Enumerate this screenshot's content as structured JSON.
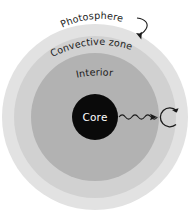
{
  "diagram": {
    "background_color": "#ffffff",
    "labels": {
      "photosphere": "Photosphere",
      "convective_zone": "Convective zone",
      "interior": "Interior",
      "core": "Core"
    },
    "layers": [
      {
        "name": "photosphere",
        "label": "Photosphere",
        "color": "#e2e2e2",
        "radius": 93,
        "shape": "circle"
      },
      {
        "name": "convective-zone",
        "label": "Convective zone",
        "color": "#d1d1d1",
        "radius": 81,
        "shape": "circle"
      },
      {
        "name": "interior",
        "label": "Interior",
        "color": "#b2b2b2",
        "radius": 64,
        "shape": "circle"
      },
      {
        "name": "core",
        "label": "Core",
        "color": "#0a0a0a",
        "radius": 23,
        "shape": "circle"
      }
    ],
    "center": {
      "cx": 95,
      "cy": 117
    },
    "annotations": [
      {
        "name": "photosphere-pointer-arrow",
        "type": "curved-arrow",
        "from": "Photosphere label",
        "to": "photosphere layer"
      },
      {
        "name": "photon-wavy-arrow",
        "type": "wavy-arrow",
        "from": "core",
        "to": "scatter point"
      },
      {
        "name": "photon-scatter-loop-arrow",
        "type": "circular-arrow",
        "at": "convective zone"
      }
    ],
    "stroke_color": "#1a1a1a",
    "text_color": "#1a1a1a",
    "core_text_color": "#ffffff"
  }
}
